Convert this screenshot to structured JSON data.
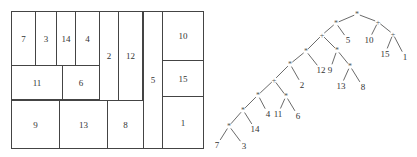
{
  "floorplan": {
    "cells": [
      {
        "label": "7",
        "x": 0,
        "y": 0,
        "w": 25,
        "h": 55
      },
      {
        "label": "3",
        "x": 24,
        "y": 0,
        "w": 22,
        "h": 55
      },
      {
        "label": "14",
        "x": 45,
        "y": 0,
        "w": 20,
        "h": 55
      },
      {
        "label": "4",
        "x": 64,
        "y": 0,
        "w": 25,
        "h": 55
      },
      {
        "label": "11",
        "x": 0,
        "y": 54,
        "w": 52,
        "h": 35
      },
      {
        "label": "6",
        "x": 51,
        "y": 54,
        "w": 38,
        "h": 35
      },
      {
        "label": "2",
        "x": 88,
        "y": 0,
        "w": 20,
        "h": 90
      },
      {
        "label": "12",
        "x": 107,
        "y": 0,
        "w": 25,
        "h": 90
      },
      {
        "label": "9",
        "x": 0,
        "y": 89,
        "w": 49,
        "h": 49
      },
      {
        "label": "13",
        "x": 48,
        "y": 89,
        "w": 49,
        "h": 49
      },
      {
        "label": "8",
        "x": 96,
        "y": 89,
        "w": 37,
        "h": 49
      },
      {
        "label": "5",
        "x": 132,
        "y": 0,
        "w": 20,
        "h": 138
      },
      {
        "label": "10",
        "x": 151,
        "y": 0,
        "w": 42,
        "h": 50
      },
      {
        "label": "15",
        "x": 151,
        "y": 49,
        "w": 42,
        "h": 37
      },
      {
        "label": "1",
        "x": 151,
        "y": 85,
        "w": 42,
        "h": 53
      }
    ]
  },
  "tree": {
    "nodes": [
      {
        "id": "n0",
        "label": "*",
        "type": "op",
        "x": 152,
        "y": 14
      },
      {
        "id": "n1",
        "label": "*",
        "type": "op",
        "x": 131,
        "y": 23
      },
      {
        "id": "n2",
        "label": "+",
        "type": "op",
        "x": 173,
        "y": 22
      },
      {
        "id": "n3",
        "label": "+",
        "type": "op",
        "x": 117,
        "y": 35
      },
      {
        "id": "n4",
        "label": "5",
        "type": "leaf",
        "x": 143,
        "y": 40
      },
      {
        "id": "n5",
        "label": "10",
        "type": "leaf",
        "x": 164,
        "y": 40
      },
      {
        "id": "n6",
        "label": "+",
        "type": "op",
        "x": 188,
        "y": 34
      },
      {
        "id": "n7",
        "label": "*",
        "type": "op",
        "x": 101,
        "y": 51
      },
      {
        "id": "n8",
        "label": "*",
        "type": "op",
        "x": 132,
        "y": 50
      },
      {
        "id": "n9",
        "label": "15",
        "type": "leaf",
        "x": 180,
        "y": 54
      },
      {
        "id": "n10",
        "label": "1",
        "type": "leaf",
        "x": 200,
        "y": 57
      },
      {
        "id": "n11",
        "label": "*",
        "type": "op",
        "x": 85,
        "y": 64
      },
      {
        "id": "n12",
        "label": "12",
        "type": "leaf",
        "x": 116,
        "y": 70
      },
      {
        "id": "n13",
        "label": "9",
        "type": "leaf",
        "x": 125,
        "y": 70
      },
      {
        "id": "n14",
        "label": "*",
        "type": "op",
        "x": 145,
        "y": 66
      },
      {
        "id": "n15",
        "label": "+",
        "type": "op",
        "x": 69,
        "y": 80
      },
      {
        "id": "n16",
        "label": "2",
        "type": "leaf",
        "x": 97,
        "y": 85
      },
      {
        "id": "n17",
        "label": "13",
        "type": "leaf",
        "x": 136,
        "y": 86
      },
      {
        "id": "n18",
        "label": "8",
        "type": "leaf",
        "x": 158,
        "y": 87
      },
      {
        "id": "n19",
        "label": "*",
        "type": "op",
        "x": 53,
        "y": 95
      },
      {
        "id": "n20",
        "label": "*",
        "type": "op",
        "x": 81,
        "y": 96
      },
      {
        "id": "n21",
        "label": "*",
        "type": "op",
        "x": 38,
        "y": 110
      },
      {
        "id": "n22",
        "label": "4",
        "type": "leaf",
        "x": 63,
        "y": 114
      },
      {
        "id": "n23",
        "label": "11",
        "type": "leaf",
        "x": 73,
        "y": 114
      },
      {
        "id": "n24",
        "label": "6",
        "type": "leaf",
        "x": 93,
        "y": 116
      },
      {
        "id": "n25",
        "label": "*",
        "type": "op",
        "x": 24,
        "y": 126
      },
      {
        "id": "n26",
        "label": "14",
        "type": "leaf",
        "x": 50,
        "y": 129
      },
      {
        "id": "n27",
        "label": "7",
        "type": "leaf",
        "x": 12,
        "y": 145
      },
      {
        "id": "n28",
        "label": "3",
        "type": "leaf",
        "x": 39,
        "y": 146
      }
    ],
    "edges": [
      [
        "n0",
        "n1"
      ],
      [
        "n0",
        "n2"
      ],
      [
        "n1",
        "n3"
      ],
      [
        "n1",
        "n4"
      ],
      [
        "n2",
        "n5"
      ],
      [
        "n2",
        "n6"
      ],
      [
        "n3",
        "n7"
      ],
      [
        "n3",
        "n8"
      ],
      [
        "n6",
        "n9"
      ],
      [
        "n6",
        "n10"
      ],
      [
        "n7",
        "n11"
      ],
      [
        "n7",
        "n12"
      ],
      [
        "n8",
        "n13"
      ],
      [
        "n8",
        "n14"
      ],
      [
        "n11",
        "n15"
      ],
      [
        "n11",
        "n16"
      ],
      [
        "n14",
        "n17"
      ],
      [
        "n14",
        "n18"
      ],
      [
        "n15",
        "n19"
      ],
      [
        "n15",
        "n20"
      ],
      [
        "n19",
        "n21"
      ],
      [
        "n19",
        "n22"
      ],
      [
        "n20",
        "n23"
      ],
      [
        "n20",
        "n24"
      ],
      [
        "n21",
        "n25"
      ],
      [
        "n21",
        "n26"
      ],
      [
        "n25",
        "n27"
      ],
      [
        "n25",
        "n28"
      ]
    ]
  }
}
